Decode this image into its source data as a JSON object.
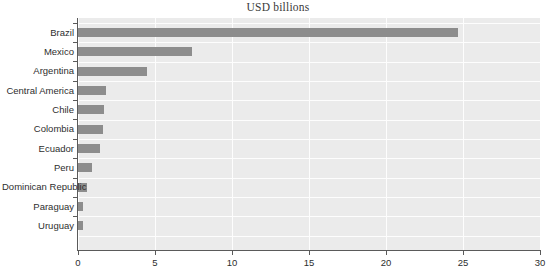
{
  "chart_data": {
    "type": "bar",
    "orientation": "horizontal",
    "title": "USD billions",
    "xlabel": "",
    "ylabel": "",
    "xlim": [
      0,
      30
    ],
    "xticks": [
      0,
      5,
      10,
      15,
      20,
      25,
      30
    ],
    "xtick_labels": [
      "0",
      "5",
      "10",
      "15",
      "20",
      "25",
      "30"
    ],
    "grid": true,
    "legend": false,
    "categories": [
      "Brazil",
      "Mexico",
      "Argentina",
      "Central America",
      "Chile",
      "Colombia",
      "Ecuador",
      "Peru",
      "Dominican Republic",
      "Paraguay",
      "Uruguay"
    ],
    "values": [
      24.7,
      7.4,
      4.5,
      1.85,
      1.7,
      1.6,
      1.45,
      0.9,
      0.6,
      0.35,
      0.35
    ],
    "bar_color": "#8d8d8d",
    "plot_background": "#ebebeb",
    "gridline_color": "#fdfdfd",
    "axis_color": "#5a5a5a"
  }
}
